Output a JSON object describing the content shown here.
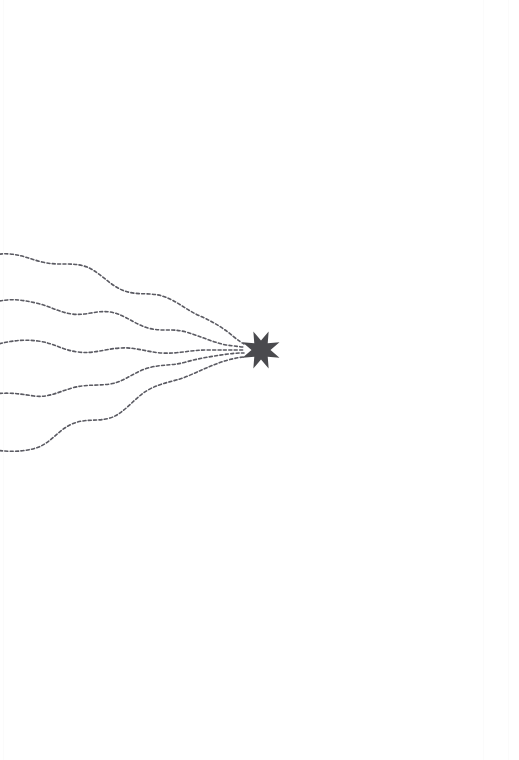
{
  "canvas": {
    "width": 519,
    "height": 760,
    "background_color": "#ffffff",
    "description": "Minimal line-art illustration: five dashed wavy trails streaming in from the left edge and converging on a solid dark-gray eight-pointed star."
  },
  "palette": {
    "background": "#ffffff",
    "trail_stroke": "#5a5a62",
    "star_fill": "#4a4a4e",
    "scan_seam": "#fbfbfb"
  },
  "star": {
    "name": "eight-pointed-star",
    "points": 8,
    "center_x": 261,
    "center_y": 350,
    "outer_radius": 20,
    "inner_radius": 9.5,
    "rotation_degrees": 22.5,
    "fill": "#4a4a4e"
  },
  "trails": {
    "count": 5,
    "stroke": "#5a5a62",
    "stroke_width": 1.6,
    "dash_pattern": "3 2.4",
    "converge_x": 244,
    "converge_y": 350,
    "items": [
      {
        "id": "trail-1",
        "label": "Trail 1 — upper, descends from top-left",
        "start_x": -6,
        "start_y": 255,
        "end_x": 244,
        "end_y": 344,
        "path": "M -6 255 C 14 251, 26 258, 42 262 C 58 266, 70 262, 84 266 C 98 270, 108 284, 122 290 C 136 296, 150 292, 162 296 C 176 300, 186 310, 200 316 C 214 322, 226 330, 234 337 C 239 341, 242 343, 244 344"
      },
      {
        "id": "trail-2",
        "label": "Trail 2 — second from top, gentle descent",
        "start_x": -6,
        "start_y": 300,
        "end_x": 244,
        "end_y": 347,
        "path": "M -6 302 C 12 298, 22 300, 36 303 C 50 306, 58 312, 72 314 C 86 316, 96 310, 110 312 C 124 314, 134 324, 148 328 C 162 332, 172 328, 186 332 C 200 336, 212 342, 226 345 C 235 346, 241 347, 244 347"
      },
      {
        "id": "trail-3",
        "label": "Trail 3 — middle, nearly horizontal with soft undulation",
        "start_x": -6,
        "start_y": 344,
        "end_x": 244,
        "end_y": 350,
        "path": "M -6 345 C 10 341, 22 339, 38 341 C 54 343, 62 350, 78 352 C 94 354, 104 349, 120 348 C 136 347, 146 352, 162 353 C 178 354, 190 350, 206 350 C 220 350, 234 350, 244 350"
      },
      {
        "id": "trail-4",
        "label": "Trail 4 — fourth, rises toward the star",
        "start_x": -6,
        "start_y": 392,
        "end_x": 244,
        "end_y": 353,
        "path": "M -6 394 C 10 392, 20 394, 34 396 C 48 398, 58 392, 72 388 C 86 384, 96 386, 110 384 C 124 382, 134 372, 148 368 C 162 364, 172 366, 186 362 C 200 358, 214 356, 228 354 C 236 353, 241 353, 244 353"
      },
      {
        "id": "trail-5",
        "label": "Trail 5 — lowest, sweeps up from bottom-left",
        "start_x": -6,
        "start_y": 450,
        "end_x": 244,
        "end_y": 357,
        "path": "M -6 450 C 10 452, 22 452, 36 448 C 50 444, 58 430, 72 424 C 86 418, 96 422, 110 418 C 124 414, 134 398, 148 390 C 162 382, 174 382, 188 376 C 202 370, 214 364, 228 360 C 236 358, 241 357, 244 357"
      }
    ]
  },
  "scan_artifacts": [
    {
      "id": "scan-seam-left",
      "x": 3
    },
    {
      "id": "scan-seam-right",
      "x": 483
    },
    {
      "id": "scan-seam-far-right",
      "x": 508
    }
  ]
}
